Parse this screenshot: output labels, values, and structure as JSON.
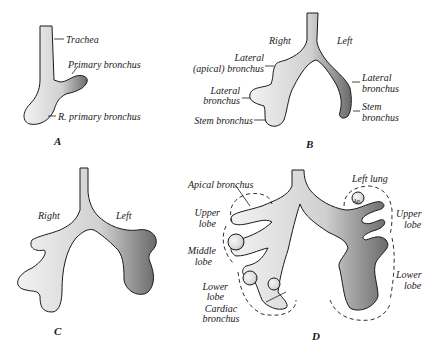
{
  "figure": {
    "panels": [
      {
        "id": "A",
        "letter": "A",
        "labels": {
          "trachea": "Trachea",
          "primary_bronchus": "Primary bronchus",
          "r_primary_bronchus": "R. primary bronchus"
        }
      },
      {
        "id": "B",
        "letter": "B",
        "labels": {
          "right": "Right",
          "left": "Left",
          "lateral_apical_1": "Lateral",
          "lateral_apical_2": "(apical) bronchus",
          "lateral_r_1": "Lateral",
          "lateral_r_2": "bronchus",
          "stem_r": "Stem bronchus",
          "lateral_l_1": "Lateral",
          "lateral_l_2": "bronchus",
          "stem_l_1": "Stem",
          "stem_l_2": "bronchus"
        }
      },
      {
        "id": "C",
        "letter": "C",
        "labels": {
          "right": "Right",
          "left": "Left"
        }
      },
      {
        "id": "D",
        "letter": "D",
        "labels": {
          "apical_bronchus": "Apical bronchus",
          "left_lung": "Left lung",
          "ap": "Ap.",
          "upper_lobe_r_1": "Upper",
          "upper_lobe_r_2": "lobe",
          "middle_lobe_1": "Middle",
          "middle_lobe_2": "lobe",
          "lower_lobe_r_1": "Lower",
          "lower_lobe_r_2": "lobe",
          "cardiac_1": "Cardiac",
          "cardiac_2": "bronchus",
          "upper_lobe_l_1": "Upper",
          "upper_lobe_l_2": "lobe",
          "lower_lobe_l_1": "Lower",
          "lower_lobe_l_2": "lobe"
        }
      }
    ]
  },
  "colors": {
    "ink": "#1a1a1a",
    "fill": "#ececec",
    "shade": "#9a9a9a",
    "background": "#ffffff"
  }
}
